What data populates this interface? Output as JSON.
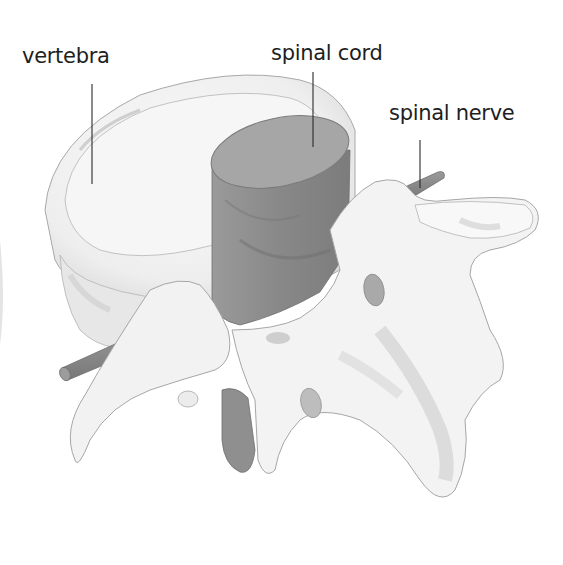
{
  "diagram": {
    "style": "grayscale pencil illustration",
    "labels": [
      {
        "id": "vertebra",
        "text": "vertebra"
      },
      {
        "id": "spinal_cord",
        "text": "spinal cord"
      },
      {
        "id": "spinal_nerve",
        "text": "spinal nerve"
      }
    ],
    "colors": {
      "background": "#ffffff",
      "bone_fill": "#f3f3f3",
      "bone_outline": "#a8a8a8",
      "bone_shade": "#cfcfcf",
      "cord_fill": "#8f8f8f",
      "cord_top": "#a9a9a9",
      "nerve_fill": "#8a8a8a",
      "leader_line": "#2a2a2a",
      "label_text": "#1e1e1e"
    }
  }
}
